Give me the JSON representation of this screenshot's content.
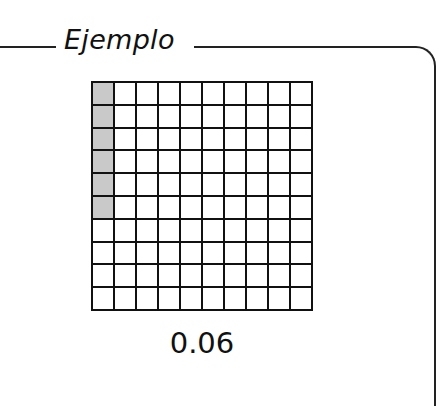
{
  "example": {
    "title": "Ejemplo",
    "value_label": "0.06",
    "grid": {
      "rows": 10,
      "cols": 10,
      "shaded_cells": [
        [
          0,
          0
        ],
        [
          1,
          0
        ],
        [
          2,
          0
        ],
        [
          3,
          0
        ],
        [
          4,
          0
        ],
        [
          5,
          0
        ]
      ],
      "shaded_count": 6,
      "shade_color": "#c9c9c9",
      "line_color": "#111111"
    }
  }
}
